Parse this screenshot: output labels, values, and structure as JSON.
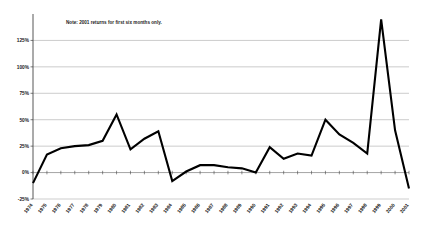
{
  "note": {
    "text": "Note: 2001 returns for first six months only."
  },
  "colors": {
    "line": "#000000",
    "grid": "#999999",
    "axis": "#555555",
    "text": "#1a1a1a",
    "background": "#ffffff"
  },
  "chart_data": {
    "type": "line",
    "title": "",
    "subtitle": "",
    "xlabel": "",
    "ylabel": "",
    "grid": true,
    "legend": false,
    "annotations": [
      "Note: 2001 returns for first six months only."
    ],
    "ylim": [
      -25,
      150
    ],
    "ytick_labels": [
      "125%",
      "100%",
      "75%",
      "50%",
      "25%",
      "0%",
      "-25%"
    ],
    "ytick_values": [
      125,
      100,
      75,
      50,
      25,
      0,
      -25
    ],
    "categories": [
      "1974",
      "1975",
      "1976",
      "1977",
      "1978",
      "1979",
      "1980",
      "1981",
      "1982",
      "1983",
      "1984",
      "1985",
      "1986",
      "1987",
      "1988",
      "1989",
      "1990",
      "1991",
      "1992",
      "1993",
      "1994",
      "1995",
      "1996",
      "1997",
      "1998",
      "1999",
      "2000",
      "2001"
    ],
    "x": [
      1974,
      1975,
      1976,
      1977,
      1978,
      1979,
      1980,
      1981,
      1982,
      1983,
      1984,
      1985,
      1986,
      1987,
      1988,
      1989,
      1990,
      1991,
      1992,
      1993,
      1994,
      1995,
      1996,
      1997,
      1998,
      1999,
      2000,
      2001
    ],
    "values": [
      -10,
      17,
      23,
      25,
      26,
      30,
      55,
      22,
      32,
      39,
      -8,
      1,
      7,
      7,
      5,
      4,
      0,
      24,
      13,
      18,
      16,
      50,
      36,
      28,
      18,
      145,
      40,
      -15
    ],
    "series": [
      {
        "name": "Annual return",
        "values": [
          -10,
          17,
          23,
          25,
          26,
          30,
          55,
          22,
          32,
          39,
          -8,
          1,
          7,
          7,
          5,
          4,
          0,
          24,
          13,
          18,
          16,
          50,
          36,
          28,
          18,
          145,
          40,
          -15
        ]
      }
    ]
  }
}
